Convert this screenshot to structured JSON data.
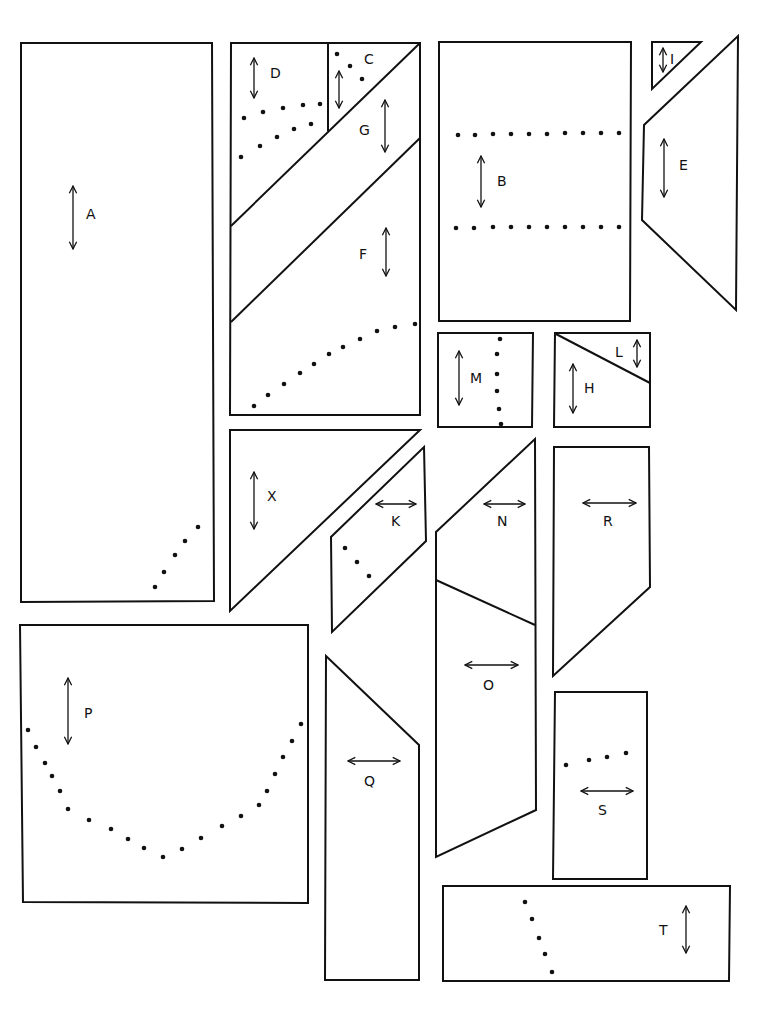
{
  "diagram": {
    "type": "sewing-pattern-cutting-layout",
    "colors": {
      "line": "#111111",
      "background": "#ffffff"
    },
    "pieces": [
      {
        "id": "A",
        "label": "A",
        "shape": "rectangle",
        "grainline": "vertical",
        "markings": "dotted line (5 dots)"
      },
      {
        "id": "D",
        "label": "D",
        "shape": "pentagon",
        "grainline": "vertical",
        "markings": "two dotted rows"
      },
      {
        "id": "C",
        "label": "C",
        "shape": "triangle",
        "grainline": "vertical",
        "markings": "3 dots"
      },
      {
        "id": "G",
        "label": "G",
        "shape": "parallelogram strip",
        "grainline": "vertical",
        "markings": ""
      },
      {
        "id": "F",
        "label": "F",
        "shape": "pentagon",
        "grainline": "vertical",
        "markings": "curved dotted line"
      },
      {
        "id": "B",
        "label": "B",
        "shape": "rectangle",
        "grainline": "vertical",
        "markings": "two dotted rows"
      },
      {
        "id": "I",
        "label": "I",
        "shape": "triangle",
        "grainline": "vertical",
        "markings": ""
      },
      {
        "id": "E",
        "label": "E",
        "shape": "trapezoid",
        "grainline": "vertical",
        "markings": ""
      },
      {
        "id": "M",
        "label": "M",
        "shape": "square",
        "grainline": "vertical",
        "markings": "vertical dotted line"
      },
      {
        "id": "L",
        "label": "L",
        "shape": "triangle",
        "grainline": "vertical",
        "markings": ""
      },
      {
        "id": "H",
        "label": "H",
        "shape": "trapezoid",
        "grainline": "vertical",
        "markings": ""
      },
      {
        "id": "X",
        "label": "X",
        "shape": "triangle",
        "grainline": "vertical",
        "markings": ""
      },
      {
        "id": "K",
        "label": "K",
        "shape": "parallelogram",
        "grainline": "horizontal",
        "markings": "3 dots"
      },
      {
        "id": "N",
        "label": "N",
        "shape": "quadrilateral",
        "grainline": "horizontal",
        "markings": ""
      },
      {
        "id": "O",
        "label": "O",
        "shape": "quadrilateral",
        "grainline": "horizontal",
        "markings": ""
      },
      {
        "id": "R",
        "label": "R",
        "shape": "pentagon",
        "grainline": "horizontal",
        "markings": ""
      },
      {
        "id": "P",
        "label": "P",
        "shape": "rectangle",
        "grainline": "vertical",
        "markings": "U-shaped dotted curve"
      },
      {
        "id": "Q",
        "label": "Q",
        "shape": "quadrilateral",
        "grainline": "horizontal",
        "markings": ""
      },
      {
        "id": "S",
        "label": "S",
        "shape": "rectangle",
        "grainline": "horizontal",
        "markings": "4 dots"
      },
      {
        "id": "T",
        "label": "T",
        "shape": "rectangle",
        "grainline": "vertical",
        "markings": "dotted line (5 dots)"
      }
    ]
  }
}
